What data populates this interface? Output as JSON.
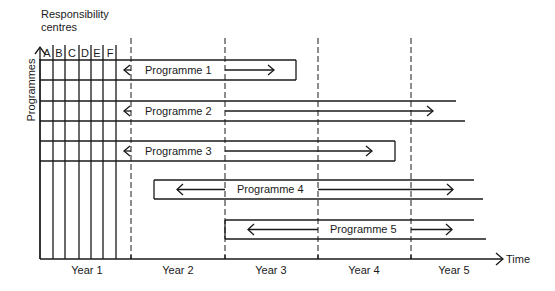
{
  "axes": {
    "y_label_line1": "Responsibility",
    "y_label_line2": "centres",
    "y_axis_label": "Programmes",
    "x_axis_label": "Time"
  },
  "columns": [
    "A",
    "B",
    "C",
    "D",
    "E",
    "F"
  ],
  "years": [
    "Year 1",
    "Year 2",
    "Year 3",
    "Year 4",
    "Year 5"
  ],
  "programmes": [
    {
      "label": "Programme 1",
      "start": "Year 1",
      "end": "Year 3"
    },
    {
      "label": "Programme 2",
      "start": "Year 1",
      "end": "Year 5 (ongoing)"
    },
    {
      "label": "Programme 3",
      "start": "Year 1",
      "end": "Year 4"
    },
    {
      "label": "Programme 4",
      "start": "Year 2",
      "end": "Year 5 (ongoing)"
    },
    {
      "label": "Programme 5",
      "start": "Year 3",
      "end": "Year 5 (ongoing)"
    }
  ],
  "colors": {
    "line": "#1a1a1a",
    "background": "#ffffff"
  }
}
